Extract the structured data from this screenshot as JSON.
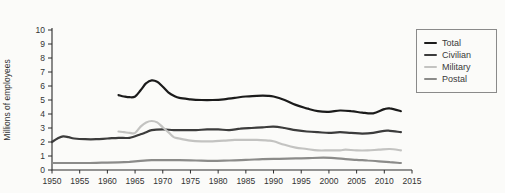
{
  "title": "Federal Government Employees, 1950–2013",
  "chart_data": {
    "type": "line",
    "title": "Federal Government Employees, 1950–2013",
    "xlabel": "",
    "ylabel": "Millions of employees",
    "xlim": [
      1950,
      2015
    ],
    "ylim": [
      0,
      10
    ],
    "xticks": [
      1950,
      1955,
      1960,
      1965,
      1970,
      1975,
      1980,
      1985,
      1990,
      1995,
      2000,
      2005,
      2010,
      2015
    ],
    "yticks": [
      0,
      1,
      2,
      3,
      4,
      5,
      6,
      7,
      8,
      9,
      10
    ],
    "grid": false,
    "legend_position": "top-right",
    "axis_color": "#2d2d2d",
    "tick_text_color": "#333333",
    "background_color": "#fbfbf9",
    "series": [
      {
        "name": "Total",
        "color": "#1b1b1b",
        "points": [
          [
            1962,
            5.35
          ],
          [
            1963,
            5.25
          ],
          [
            1964,
            5.2
          ],
          [
            1965,
            5.25
          ],
          [
            1966,
            5.7
          ],
          [
            1967,
            6.2
          ],
          [
            1968,
            6.4
          ],
          [
            1969,
            6.3
          ],
          [
            1970,
            5.95
          ],
          [
            1971,
            5.55
          ],
          [
            1972,
            5.3
          ],
          [
            1973,
            5.15
          ],
          [
            1975,
            5.05
          ],
          [
            1977,
            5.0
          ],
          [
            1979,
            5.0
          ],
          [
            1981,
            5.05
          ],
          [
            1983,
            5.15
          ],
          [
            1985,
            5.25
          ],
          [
            1987,
            5.3
          ],
          [
            1989,
            5.3
          ],
          [
            1990,
            5.25
          ],
          [
            1992,
            5.0
          ],
          [
            1994,
            4.65
          ],
          [
            1996,
            4.4
          ],
          [
            1998,
            4.2
          ],
          [
            2000,
            4.15
          ],
          [
            2002,
            4.25
          ],
          [
            2004,
            4.2
          ],
          [
            2006,
            4.1
          ],
          [
            2008,
            4.05
          ],
          [
            2010,
            4.35
          ],
          [
            2011,
            4.4
          ],
          [
            2013,
            4.2
          ]
        ]
      },
      {
        "name": "Civilian",
        "color": "#3c3c3c",
        "points": [
          [
            1950,
            2.0
          ],
          [
            1951,
            2.25
          ],
          [
            1952,
            2.4
          ],
          [
            1953,
            2.35
          ],
          [
            1954,
            2.25
          ],
          [
            1956,
            2.2
          ],
          [
            1958,
            2.2
          ],
          [
            1960,
            2.25
          ],
          [
            1962,
            2.3
          ],
          [
            1964,
            2.3
          ],
          [
            1966,
            2.55
          ],
          [
            1967,
            2.7
          ],
          [
            1968,
            2.85
          ],
          [
            1970,
            2.9
          ],
          [
            1972,
            2.85
          ],
          [
            1974,
            2.85
          ],
          [
            1976,
            2.85
          ],
          [
            1978,
            2.9
          ],
          [
            1980,
            2.9
          ],
          [
            1982,
            2.85
          ],
          [
            1984,
            2.95
          ],
          [
            1986,
            3.0
          ],
          [
            1988,
            3.05
          ],
          [
            1990,
            3.1
          ],
          [
            1992,
            3.0
          ],
          [
            1994,
            2.85
          ],
          [
            1996,
            2.75
          ],
          [
            1998,
            2.7
          ],
          [
            2000,
            2.65
          ],
          [
            2002,
            2.7
          ],
          [
            2004,
            2.65
          ],
          [
            2006,
            2.6
          ],
          [
            2008,
            2.65
          ],
          [
            2010,
            2.8
          ],
          [
            2011,
            2.8
          ],
          [
            2013,
            2.7
          ]
        ]
      },
      {
        "name": "Military",
        "color": "#c3c3c1",
        "points": [
          [
            1962,
            2.75
          ],
          [
            1963,
            2.7
          ],
          [
            1964,
            2.65
          ],
          [
            1965,
            2.65
          ],
          [
            1966,
            3.1
          ],
          [
            1967,
            3.4
          ],
          [
            1968,
            3.5
          ],
          [
            1969,
            3.4
          ],
          [
            1970,
            3.05
          ],
          [
            1971,
            2.7
          ],
          [
            1972,
            2.35
          ],
          [
            1973,
            2.25
          ],
          [
            1975,
            2.1
          ],
          [
            1977,
            2.05
          ],
          [
            1979,
            2.05
          ],
          [
            1981,
            2.1
          ],
          [
            1983,
            2.15
          ],
          [
            1985,
            2.15
          ],
          [
            1987,
            2.15
          ],
          [
            1989,
            2.1
          ],
          [
            1990,
            2.05
          ],
          [
            1992,
            1.8
          ],
          [
            1994,
            1.6
          ],
          [
            1996,
            1.5
          ],
          [
            1998,
            1.4
          ],
          [
            2000,
            1.4
          ],
          [
            2002,
            1.4
          ],
          [
            2003,
            1.45
          ],
          [
            2005,
            1.4
          ],
          [
            2007,
            1.4
          ],
          [
            2009,
            1.45
          ],
          [
            2011,
            1.5
          ],
          [
            2013,
            1.4
          ]
        ]
      },
      {
        "name": "Postal",
        "color": "#8b8b89",
        "points": [
          [
            1950,
            0.5
          ],
          [
            1953,
            0.5
          ],
          [
            1956,
            0.5
          ],
          [
            1959,
            0.52
          ],
          [
            1962,
            0.55
          ],
          [
            1964,
            0.58
          ],
          [
            1966,
            0.65
          ],
          [
            1968,
            0.7
          ],
          [
            1970,
            0.7
          ],
          [
            1973,
            0.7
          ],
          [
            1976,
            0.68
          ],
          [
            1979,
            0.66
          ],
          [
            1982,
            0.68
          ],
          [
            1985,
            0.72
          ],
          [
            1988,
            0.78
          ],
          [
            1991,
            0.8
          ],
          [
            1994,
            0.83
          ],
          [
            1997,
            0.86
          ],
          [
            1999,
            0.88
          ],
          [
            2001,
            0.85
          ],
          [
            2003,
            0.78
          ],
          [
            2005,
            0.72
          ],
          [
            2007,
            0.68
          ],
          [
            2009,
            0.62
          ],
          [
            2011,
            0.56
          ],
          [
            2013,
            0.5
          ]
        ]
      }
    ]
  }
}
